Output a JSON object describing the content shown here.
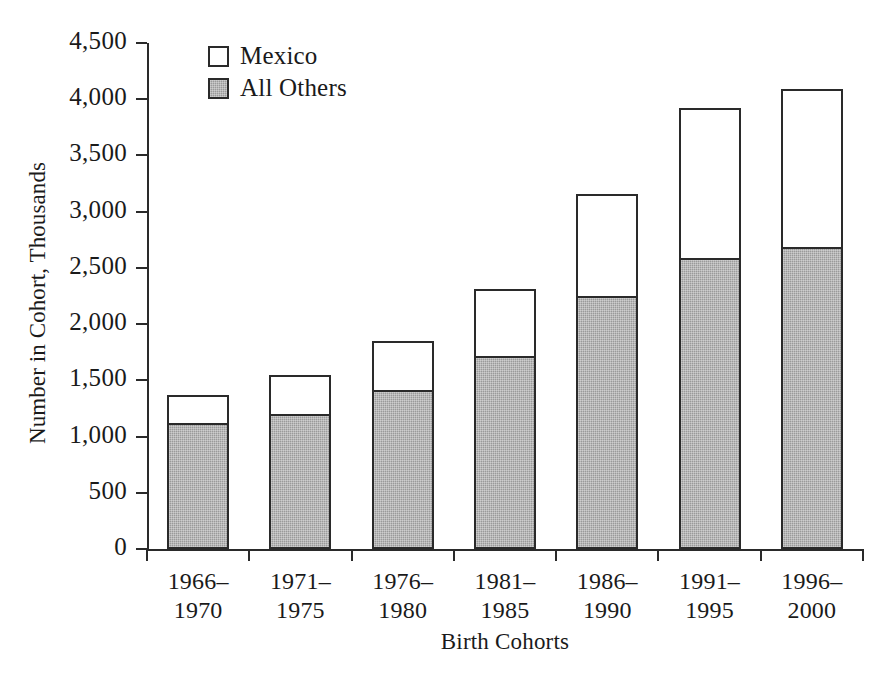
{
  "chart_data": {
    "type": "bar",
    "subtype": "stacked-bar",
    "title": "",
    "xlabel": "Birth Cohorts",
    "ylabel": "Number in Cohort, Thousands",
    "categories": [
      "1966–1970",
      "1971–1975",
      "1976–1980",
      "1981–1985",
      "1986–1990",
      "1991–1995",
      "1996–2000"
    ],
    "category_lines": [
      [
        "1966–",
        "1970"
      ],
      [
        "1971–",
        "1975"
      ],
      [
        "1976–",
        "1980"
      ],
      [
        "1981–",
        "1985"
      ],
      [
        "1986–",
        "1990"
      ],
      [
        "1991–",
        "1995"
      ],
      [
        "1996–",
        "2000"
      ]
    ],
    "series": [
      {
        "name": "All Others",
        "color": "#9a9a9a",
        "values": [
          1120,
          1200,
          1410,
          1720,
          2250,
          2590,
          2690
        ]
      },
      {
        "name": "Mexico",
        "color": "#ffffff",
        "values": [
          250,
          350,
          440,
          590,
          910,
          1330,
          1400
        ]
      }
    ],
    "totals": [
      1370,
      1550,
      1850,
      2310,
      3160,
      3920,
      4090
    ],
    "ylim": [
      0,
      4500
    ],
    "ytick_values": [
      0,
      500,
      1000,
      1500,
      2000,
      2500,
      3000,
      3500,
      4000,
      4500
    ],
    "ytick_labels": [
      "0",
      "500",
      "1,000",
      "1,500",
      "2,000",
      "2,500",
      "3,000",
      "3,500",
      "4,000",
      "4,500"
    ],
    "grid": false,
    "legend_position": "top-left-inside",
    "legend": [
      {
        "label": "Mexico",
        "swatch": "white"
      },
      {
        "label": "All Others",
        "swatch": "gray"
      }
    ]
  },
  "axes": {
    "y_title": "Number in Cohort, Thousands",
    "x_title": "Birth Cohorts"
  },
  "legend": {
    "mexico_label": "Mexico",
    "all_others_label": "All Others"
  },
  "colors": {
    "axis": "#2a2a2a",
    "others_fill": "#9a9a9a",
    "mexico_fill": "#ffffff",
    "background": "#ffffff"
  }
}
